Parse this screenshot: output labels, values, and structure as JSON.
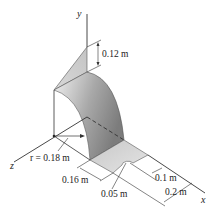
{
  "figure": {
    "axes": {
      "x": "x",
      "y": "y",
      "z": "z"
    },
    "dimensions": {
      "height_top": "0.12 m",
      "radius": "r = 0.18 m",
      "plate_length": "0.16 m",
      "hole_radius": "0.05 m",
      "hole_offset": "0.1 m",
      "plate_width": "0.2 m"
    },
    "colors": {
      "line": "#333333",
      "sheet_light": "#e2e2e2",
      "sheet_dark": "#8a8a8a",
      "plate": "#d4d4d4"
    }
  }
}
